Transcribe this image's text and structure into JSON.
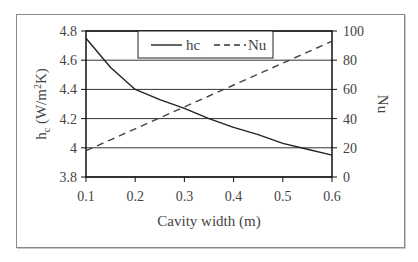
{
  "chart_data": {
    "type": "line",
    "title": "",
    "xlabel": "Cavity width (m)",
    "ylabel": "hc (W/m2K)",
    "ylabel_parts": {
      "main": "h",
      "sub": "c",
      "unit_pre": " (W/m",
      "sup": "2",
      "unit_post": "K)"
    },
    "y2label": "Nu",
    "xlim": [
      0.1,
      0.6
    ],
    "ylim": [
      3.8,
      4.8
    ],
    "y2lim": [
      0,
      100
    ],
    "x_ticks": [
      "0.1",
      "0.2",
      "0.3",
      "0.4",
      "0.5",
      "0.6"
    ],
    "y_ticks": [
      "3.8",
      "4",
      "4.2",
      "4.4",
      "4.6",
      "4.8"
    ],
    "y2_ticks": [
      "0",
      "20",
      "40",
      "60",
      "80",
      "100"
    ],
    "grid": true,
    "legend_position": "top-center",
    "x": [
      0.1,
      0.15,
      0.2,
      0.25,
      0.3,
      0.35,
      0.4,
      0.45,
      0.5,
      0.55,
      0.6
    ],
    "series": [
      {
        "name": "hc",
        "axis": "left",
        "style": "solid",
        "values": [
          4.75,
          4.55,
          4.4,
          4.33,
          4.27,
          4.2,
          4.14,
          4.09,
          4.03,
          3.99,
          3.95
        ]
      },
      {
        "name": "Nu",
        "axis": "right",
        "style": "dashed",
        "values": [
          18,
          25.5,
          33,
          40.5,
          48,
          55.5,
          63,
          70.5,
          78,
          85.5,
          93
        ]
      }
    ]
  },
  "legend": {
    "items": [
      "hc",
      "Nu"
    ]
  }
}
